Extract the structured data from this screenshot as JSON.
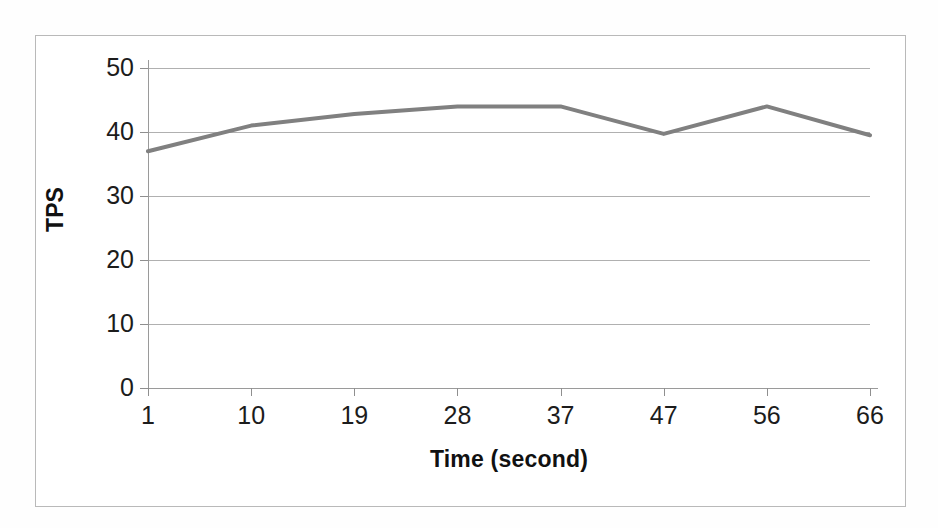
{
  "chart_data": {
    "type": "line",
    "title": "",
    "xlabel": "Time (second)",
    "ylabel": "TPS",
    "x": [
      1,
      10,
      19,
      28,
      37,
      47,
      56,
      66
    ],
    "xtick_labels": [
      "1",
      "10",
      "19",
      "28",
      "37",
      "47",
      "56",
      "66"
    ],
    "ytick_labels": [
      "0",
      "10",
      "20",
      "30",
      "40",
      "50"
    ],
    "yticks": [
      0,
      10,
      20,
      30,
      40,
      50
    ],
    "ylim": [
      0,
      50
    ],
    "grid": "horizontal",
    "legend": "none",
    "series": [
      {
        "name": "TPS",
        "color": "#808080",
        "values": [
          37.0,
          41.0,
          42.8,
          44.0,
          44.0,
          39.7,
          44.0,
          39.5
        ]
      }
    ]
  },
  "figure": {
    "background_color": "#ffffff",
    "frame_color": "#b9b9b9",
    "axis_color": "#9a9a9a",
    "gridline_color": "#b0b0b0",
    "line_color": "#808080"
  }
}
